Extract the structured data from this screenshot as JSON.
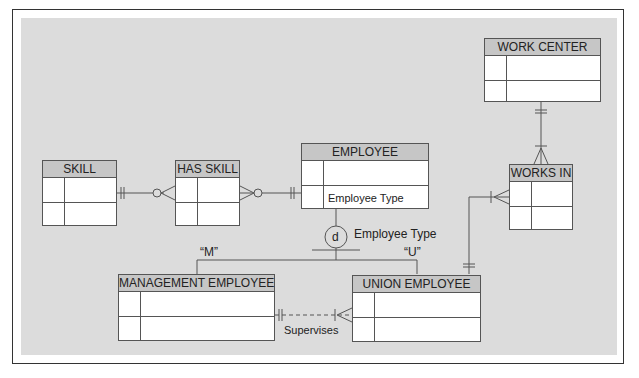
{
  "diagram": {
    "type": "ER diagram with supertype/subtype",
    "entities": {
      "skill": {
        "name": "SKILL"
      },
      "has_skill": {
        "name": "HAS SKILL"
      },
      "employee": {
        "name": "EMPLOYEE",
        "attributes": [
          "",
          "Employee Type"
        ]
      },
      "work_center": {
        "name": "WORK CENTER"
      },
      "works_in": {
        "name": "WORKS IN"
      },
      "management_employee": {
        "name": "MANAGEMENT EMPLOYEE"
      },
      "union_employee": {
        "name": "UNION EMPLOYEE"
      }
    },
    "subtype_discriminator": {
      "symbol": "d",
      "attribute_label": "Employee Type",
      "values": {
        "management": "“M”",
        "union": "“U”"
      }
    },
    "relationships": {
      "supervises": "Supervises"
    },
    "colors": {
      "canvas": "#dcdcdc",
      "header": "#c6c6c6",
      "line": "#555555"
    }
  }
}
